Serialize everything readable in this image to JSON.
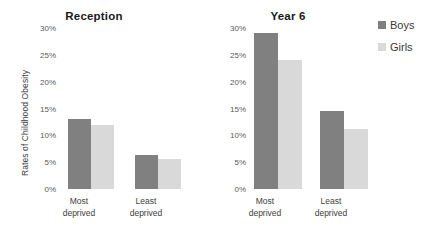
{
  "chart_data": {
    "type": "bar",
    "title": "",
    "ylabel": "Rates of Childhood Obesity",
    "xlabel": "",
    "ylim": [
      0,
      30
    ],
    "ytick_labels": [
      "30%",
      "25%",
      "20%",
      "15%",
      "10%",
      "5%",
      "0%"
    ],
    "ytick_values": [
      30,
      25,
      20,
      15,
      10,
      5,
      0
    ],
    "grid": false,
    "legend_position": "right",
    "categories": [
      "Most deprived",
      "Least deprived"
    ],
    "series": [
      {
        "name": "Boys",
        "color": "#808080"
      },
      {
        "name": "Girls",
        "color": "#d9d9d9"
      }
    ],
    "panels": [
      {
        "title": "Reception",
        "categories": [
          "Most deprived",
          "Least deprived"
        ],
        "series": [
          {
            "name": "Boys",
            "values": [
              13.0,
              6.3
            ]
          },
          {
            "name": "Girls",
            "values": [
              12.0,
              5.5
            ]
          }
        ]
      },
      {
        "title": "Year 6",
        "categories": [
          "Most deprived",
          "Least deprived"
        ],
        "series": [
          {
            "name": "Boys",
            "values": [
              29.0,
              14.5
            ]
          },
          {
            "name": "Girls",
            "values": [
              24.0,
              11.2
            ]
          }
        ]
      }
    ]
  },
  "legend": {
    "items": [
      {
        "label": "Boys",
        "color": "#808080"
      },
      {
        "label": "Girls",
        "color": "#d9d9d9"
      }
    ]
  },
  "axis": {
    "y_title": "Rates of Childhood Obesity"
  },
  "category_labels": [
    {
      "line1": "Most",
      "line2": "deprived"
    },
    {
      "line1": "Least",
      "line2": "deprived"
    }
  ]
}
